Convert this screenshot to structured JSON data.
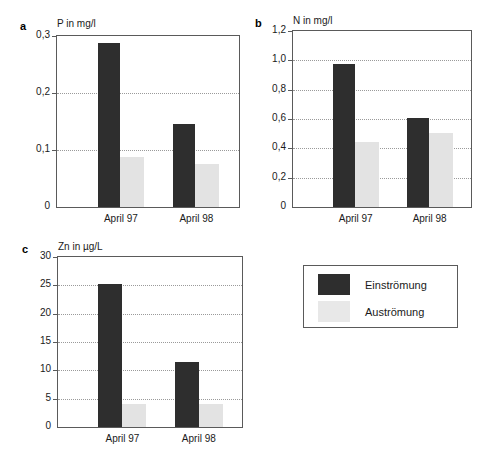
{
  "figure": {
    "legend": {
      "entries": [
        {
          "label": "Einströmung",
          "swatch": "dark",
          "color": "#2e2e2e"
        },
        {
          "label": "Auströmung",
          "swatch": "light",
          "color": "#e8e8e8"
        }
      ]
    }
  },
  "chart_data": [
    {
      "type": "bar",
      "panel": "a",
      "title": "P in mg/l",
      "xlabel": "",
      "ylabel": "P in mg/l",
      "categories": [
        "April 97",
        "April 98"
      ],
      "series": [
        {
          "name": "Einströmung",
          "color": "#2e2e2e",
          "values": [
            0.287,
            0.145
          ]
        },
        {
          "name": "Auströmung",
          "color": "#e3e3e3",
          "values": [
            0.088,
            0.075
          ]
        }
      ],
      "ylim": [
        0,
        0.3
      ],
      "yticks": [
        0,
        0.1,
        0.2,
        0.3
      ],
      "ytick_labels": [
        "0",
        "0,1",
        "0,2",
        "0,3"
      ],
      "grid": true,
      "legend_position": "external"
    },
    {
      "type": "bar",
      "panel": "b",
      "title": "N in mg/l",
      "xlabel": "",
      "ylabel": "N in mg/l",
      "categories": [
        "April 97",
        "April 98"
      ],
      "series": [
        {
          "name": "Einströmung",
          "color": "#2e2e2e",
          "values": [
            0.975,
            0.61
          ]
        },
        {
          "name": "Auströmung",
          "color": "#e3e3e3",
          "values": [
            0.445,
            0.505
          ]
        }
      ],
      "ylim": [
        0,
        1.2
      ],
      "yticks": [
        0,
        0.2,
        0.4,
        0.6,
        0.8,
        1.0,
        1.2
      ],
      "ytick_labels": [
        "0",
        "0,2",
        "0,4",
        "0,6",
        "0,8",
        "1,0",
        "1,2"
      ],
      "grid": true,
      "legend_position": "external"
    },
    {
      "type": "bar",
      "panel": "c",
      "title": "Zn in µg/L",
      "xlabel": "",
      "ylabel": "Zn in µg/L",
      "categories": [
        "April 97",
        "April 98"
      ],
      "series": [
        {
          "name": "Einströmung",
          "color": "#2e2e2e",
          "values": [
            25.2,
            11.5
          ]
        },
        {
          "name": "Auströmung",
          "color": "#e3e3e3",
          "values": [
            4.0,
            4.0
          ]
        }
      ],
      "ylim": [
        0,
        30
      ],
      "yticks": [
        0,
        5,
        10,
        15,
        20,
        25,
        30
      ],
      "ytick_labels": [
        "0",
        "5",
        "10",
        "15",
        "20",
        "25",
        "30"
      ],
      "grid": true,
      "legend_position": "external"
    }
  ]
}
